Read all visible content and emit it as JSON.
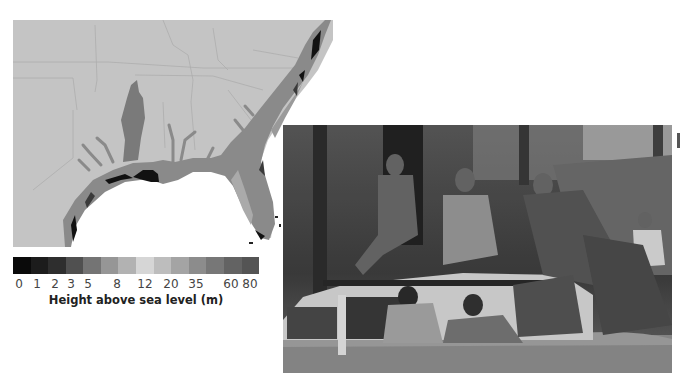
{
  "figure": {
    "map": {
      "description": "Southeastern United States coastal elevation map",
      "background_land_color": "#c4c4c4",
      "ocean_color": "#ffffff",
      "state_line_color": "#adadad"
    },
    "legend": {
      "title": "Height above sea level (m)",
      "swatches": [
        "#0a0a0a",
        "#1c1c1c",
        "#2e2e2e",
        "#505050",
        "#747474",
        "#969696",
        "#b2b2b2",
        "#d6d6d6",
        "#bdbdbd",
        "#a4a4a4",
        "#8c8c8c",
        "#777777",
        "#636363",
        "#545454"
      ],
      "ticks": [
        {
          "label": "0",
          "x": 6
        },
        {
          "label": "1",
          "x": 24
        },
        {
          "label": "2",
          "x": 42
        },
        {
          "label": "3",
          "x": 58
        },
        {
          "label": "5",
          "x": 75
        },
        {
          "label": "8",
          "x": 104
        },
        {
          "label": "12",
          "x": 132
        },
        {
          "label": "20",
          "x": 158
        },
        {
          "label": "35",
          "x": 183
        },
        {
          "label": "60",
          "x": 218
        },
        {
          "label": "80",
          "x": 237
        }
      ]
    },
    "photo": {
      "description": "People climbing onto the roof of a white vehicle submerged in floodwater, trees in background"
    }
  }
}
